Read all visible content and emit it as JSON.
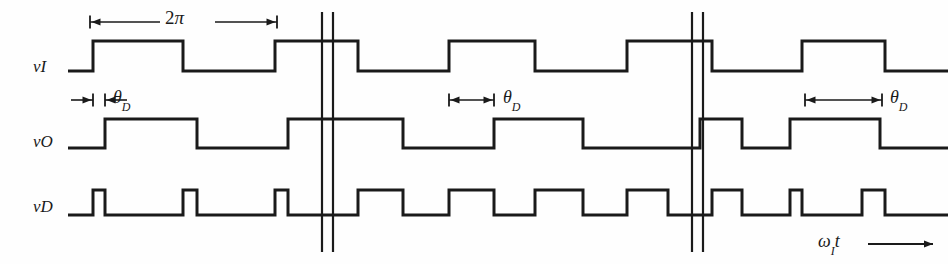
{
  "figure": {
    "type": "waveform-timing-diagram",
    "background_color": "#fefefe",
    "line_color": "#1a1a1a",
    "width": 948,
    "height": 264
  },
  "signal_labels": [
    {
      "name": "v-sub-I",
      "base": "v",
      "subscript": "I",
      "y": 68
    },
    {
      "name": "v-sub-O",
      "base": "v",
      "subscript": "O",
      "y": 143
    },
    {
      "name": "v-sub-D",
      "base": "v",
      "subscript": "D",
      "y": 208
    }
  ],
  "annotations": {
    "period": {
      "label": "2",
      "symbol": "π",
      "full": "2π",
      "x1": 90,
      "x2": 277,
      "y": 22
    },
    "theta_d": [
      {
        "label": "θ",
        "subscript": "D",
        "full": "θD",
        "x1": 93,
        "x2": 105,
        "y": 100,
        "style": "outward",
        "section": 1
      },
      {
        "label": "θ",
        "subscript": "D",
        "full": "θD",
        "x1": 449,
        "x2": 494,
        "y": 100,
        "style": "inward",
        "section": 2
      },
      {
        "label": "θ",
        "subscript": "D",
        "full": "θD",
        "x1": 805,
        "x2": 882,
        "y": 100,
        "style": "inward",
        "section": 3
      }
    ],
    "axis": {
      "base": "ω",
      "subscript": "I",
      "variable": "t",
      "full": "ωIt",
      "x": 818,
      "y": 244,
      "arrow_x1": 868,
      "arrow_x2": 933
    }
  },
  "break_marks": [
    {
      "name": "break-left-a",
      "x": 322,
      "y1": 12,
      "y2": 252
    },
    {
      "name": "break-left-b",
      "x": 333,
      "y1": 12,
      "y2": 252
    },
    {
      "name": "break-right-a",
      "x": 692,
      "y1": 12,
      "y2": 252
    },
    {
      "name": "break-right-b",
      "x": 703,
      "y1": 12,
      "y2": 252
    }
  ],
  "chart_data": {
    "type": "line",
    "title": "",
    "xlabel": "ωIt",
    "ylabel": "",
    "grid": false,
    "legend": "none",
    "series": [
      {
        "name": "vI",
        "label": "v_I",
        "high_y": 41,
        "low_y": 71,
        "start_level": "low",
        "transitions": [
          93,
          183,
          275,
          358,
          449,
          535,
          627,
          712,
          802,
          885
        ],
        "end_x": 948,
        "start_x": 68
      },
      {
        "name": "vO",
        "label": "v_O",
        "high_y": 119,
        "low_y": 148,
        "start_level": "low",
        "transitions": [
          105,
          197,
          288,
          403,
          494,
          583,
          700,
          742,
          790,
          880
        ],
        "end_x": 948,
        "start_x": 68
      },
      {
        "name": "vD",
        "label": "v_D",
        "high_y": 190,
        "low_y": 215,
        "start_level": "low",
        "transitions": [
          93,
          105,
          183,
          197,
          275,
          288,
          358,
          403,
          449,
          494,
          535,
          583,
          627,
          668,
          712,
          742,
          790,
          802,
          862,
          885
        ],
        "end_x": 948,
        "start_x": 68
      }
    ],
    "sections": [
      {
        "name": "small-phase-delay",
        "x_start": 68,
        "x_end": 322,
        "theta_d_px": 12
      },
      {
        "name": "quadrature-phase-delay",
        "x_start": 333,
        "x_end": 692,
        "theta_d_px": 45
      },
      {
        "name": "large-phase-delay",
        "x_start": 703,
        "x_end": 948,
        "theta_d_px": 77
      }
    ]
  }
}
